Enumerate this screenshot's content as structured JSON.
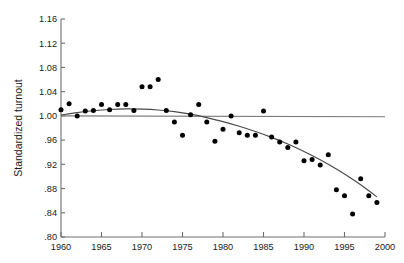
{
  "chart_data": {
    "type": "scatter",
    "title": "",
    "xlabel": "",
    "ylabel": "Standardized turnout",
    "xlim": [
      1960,
      2000
    ],
    "ylim": [
      0.8,
      1.16
    ],
    "grid": false,
    "legend": "none",
    "x_ticks": [
      "1960",
      "1965",
      "1970",
      "1975",
      "1980",
      "1985",
      "1990",
      "1995",
      "2000"
    ],
    "x_tick_values": [
      1960,
      1965,
      1970,
      1975,
      1980,
      1985,
      1990,
      1995,
      2000
    ],
    "y_ticks": [
      "1.16",
      "1.12",
      "1.08",
      "1.04",
      "1.00",
      ".96",
      ".92",
      ".88",
      ".84",
      ".80"
    ],
    "y_tick_values": [
      1.16,
      1.12,
      1.08,
      1.04,
      1.0,
      0.96,
      0.92,
      0.88,
      0.84,
      0.8
    ],
    "series": [
      {
        "name": "Standardized turnout",
        "type": "scatter",
        "marker": "filled-circle",
        "color": "#000000",
        "x": [
          1960,
          1961,
          1962,
          1963,
          1964,
          1965,
          1966,
          1967,
          1968,
          1969,
          1970,
          1971,
          1972,
          1973,
          1974,
          1975,
          1976,
          1977,
          1978,
          1979,
          1980,
          1981,
          1982,
          1983,
          1984,
          1985,
          1986,
          1987,
          1988,
          1989,
          1990,
          1991,
          1992,
          1993,
          1994,
          1995,
          1996,
          1997,
          1998,
          1999
        ],
        "y": [
          1.01,
          1.02,
          1.0,
          1.008,
          1.009,
          1.019,
          1.01,
          1.019,
          1.019,
          1.009,
          1.048,
          1.048,
          1.06,
          1.009,
          0.99,
          0.968,
          1.002,
          1.019,
          0.99,
          0.958,
          0.978,
          1.0,
          0.972,
          0.968,
          0.968,
          1.008,
          0.965,
          0.957,
          0.948,
          0.957,
          0.926,
          0.928,
          0.919,
          0.936,
          0.878,
          0.868,
          0.838,
          0.896,
          0.868,
          0.857
        ]
      },
      {
        "name": "Fitted trend",
        "type": "line",
        "color": "#4a4a4a",
        "x": [
          1960,
          1962,
          1964,
          1966,
          1968,
          1970,
          1972,
          1974,
          1976,
          1978,
          1980,
          1982,
          1984,
          1986,
          1988,
          1990,
          1992,
          1994,
          1996,
          1998,
          1999
        ],
        "y": [
          1.0015,
          1.0055,
          1.0085,
          1.0105,
          1.0115,
          1.0112,
          1.0098,
          1.007,
          1.0028,
          0.9972,
          0.9905,
          0.9828,
          0.9742,
          0.9645,
          0.9535,
          0.9412,
          0.9275,
          0.9122,
          0.8952,
          0.8765,
          0.8662
        ]
      },
      {
        "name": "Reference line",
        "type": "line",
        "color": "#7a7a7a",
        "x": [
          1960,
          2000
        ],
        "y": [
          1.0,
          0.9985
        ]
      }
    ]
  }
}
